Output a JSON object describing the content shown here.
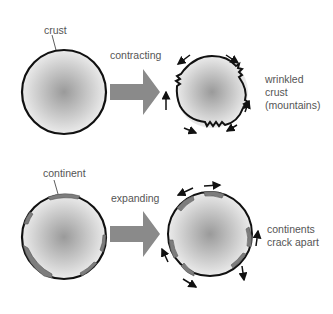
{
  "top_panel": {
    "crust_label": "crust",
    "process_label": "contracting",
    "result_label_lines": [
      "wrinkled",
      "crust",
      "(mountains)"
    ]
  },
  "bottom_panel": {
    "continent_label": "continent",
    "process_label": "expanding",
    "result_label_lines": [
      "continents",
      "crack apart"
    ]
  },
  "colors": {
    "outline": "#111111",
    "arrow_fill": "#8a8a8a",
    "continent_fill": "#7d7d7d",
    "sphere_center": "#9a9a9a",
    "sphere_edge": "#f2f2f2",
    "label_text": "#555555"
  }
}
